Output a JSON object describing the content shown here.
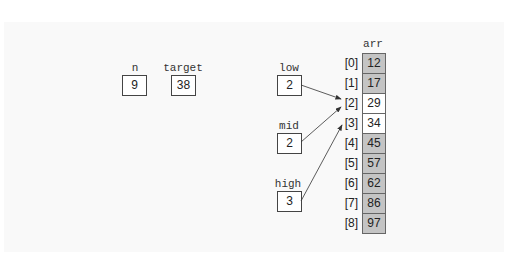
{
  "variables": [
    {
      "name": "n",
      "value": "9"
    },
    {
      "name": "target",
      "value": "38"
    }
  ],
  "pointers": [
    {
      "name": "low",
      "value": "2",
      "points_to": 2
    },
    {
      "name": "mid",
      "value": "2",
      "points_to": 2
    },
    {
      "name": "high",
      "value": "3",
      "points_to": 3
    }
  ],
  "array": {
    "name": "arr",
    "indices": [
      "[0]",
      "[1]",
      "[2]",
      "[3]",
      "[4]",
      "[5]",
      "[6]",
      "[7]",
      "[8]"
    ],
    "values": [
      "12",
      "17",
      "29",
      "34",
      "45",
      "57",
      "62",
      "86",
      "97"
    ],
    "active": [
      false,
      false,
      true,
      true,
      false,
      false,
      false,
      false,
      false
    ]
  },
  "colors": {
    "shaded": "#c4c4c4",
    "active": "#ffffff",
    "border": "#555555"
  }
}
